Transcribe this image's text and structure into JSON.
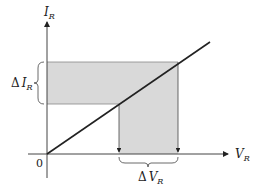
{
  "diagram": {
    "y_axis": {
      "label": "I",
      "subscript": "R"
    },
    "x_axis": {
      "label": "V",
      "subscript": "R"
    },
    "origin_label": "0",
    "delta_i": {
      "prefix": "Δ",
      "label": "I",
      "subscript": "R"
    },
    "delta_v": {
      "prefix": "Δ",
      "label": "V",
      "subscript": "R"
    },
    "colors": {
      "shade": "#d9d9d9",
      "line": "#222222",
      "axis": "#444444"
    }
  }
}
